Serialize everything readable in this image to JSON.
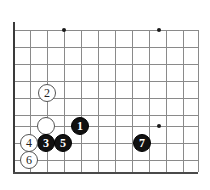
{
  "diagram": {
    "type": "go-board-diagram",
    "colors": {
      "background": "#ffffff",
      "grid_line": "#8a8a8a",
      "board_edge": "#3a3a3a",
      "star_point": "#1a1a1a",
      "black_stone": "#111111",
      "white_stone": "#ffffff",
      "white_stone_outline": "#555555"
    },
    "geometry": {
      "width": 210,
      "height": 190,
      "grid_spacing": 17,
      "origin_x": 13,
      "origin_y": 30,
      "columns": 11,
      "rows": 9,
      "left_edge_x": 13,
      "top_line_y": 30,
      "bottom_edge_y": 172,
      "right_extent_x": 198
    },
    "star_points": [
      {
        "name": "hoshi-top-left",
        "x": 64,
        "y": 30
      },
      {
        "name": "hoshi-top-right",
        "x": 159,
        "y": 30
      },
      {
        "name": "hoshi-bottom-right",
        "x": 159,
        "y": 126
      }
    ],
    "vertical_lines_x": [
      13,
      30,
      47,
      64,
      81,
      98,
      115,
      132,
      149,
      166,
      183,
      198
    ],
    "horizontal_lines_y": [
      30,
      47,
      64,
      81,
      98,
      115,
      126,
      143,
      160,
      172
    ],
    "stones": [
      {
        "id": "stone-white-unnumbered",
        "color": "white",
        "label": "",
        "x": 46,
        "y": 126,
        "radius": 9
      },
      {
        "id": "stone-black-1",
        "color": "black",
        "label": "1",
        "x": 80,
        "y": 126,
        "radius": 9
      },
      {
        "id": "stone-white-2",
        "color": "white",
        "label": "2",
        "x": 47,
        "y": 93,
        "radius": 9
      },
      {
        "id": "stone-black-3",
        "color": "black",
        "label": "3",
        "x": 46,
        "y": 143,
        "radius": 9
      },
      {
        "id": "stone-white-4",
        "color": "white",
        "label": "4",
        "x": 29,
        "y": 143,
        "radius": 9
      },
      {
        "id": "stone-black-5",
        "color": "black",
        "label": "5",
        "x": 63,
        "y": 143,
        "radius": 9
      },
      {
        "id": "stone-white-6",
        "color": "white",
        "label": "6",
        "x": 29,
        "y": 160,
        "radius": 9
      },
      {
        "id": "stone-black-7",
        "color": "black",
        "label": "7",
        "x": 142,
        "y": 143,
        "radius": 9
      }
    ],
    "move_sequence": [
      "1",
      "2",
      "3",
      "4",
      "5",
      "6",
      "7"
    ]
  }
}
